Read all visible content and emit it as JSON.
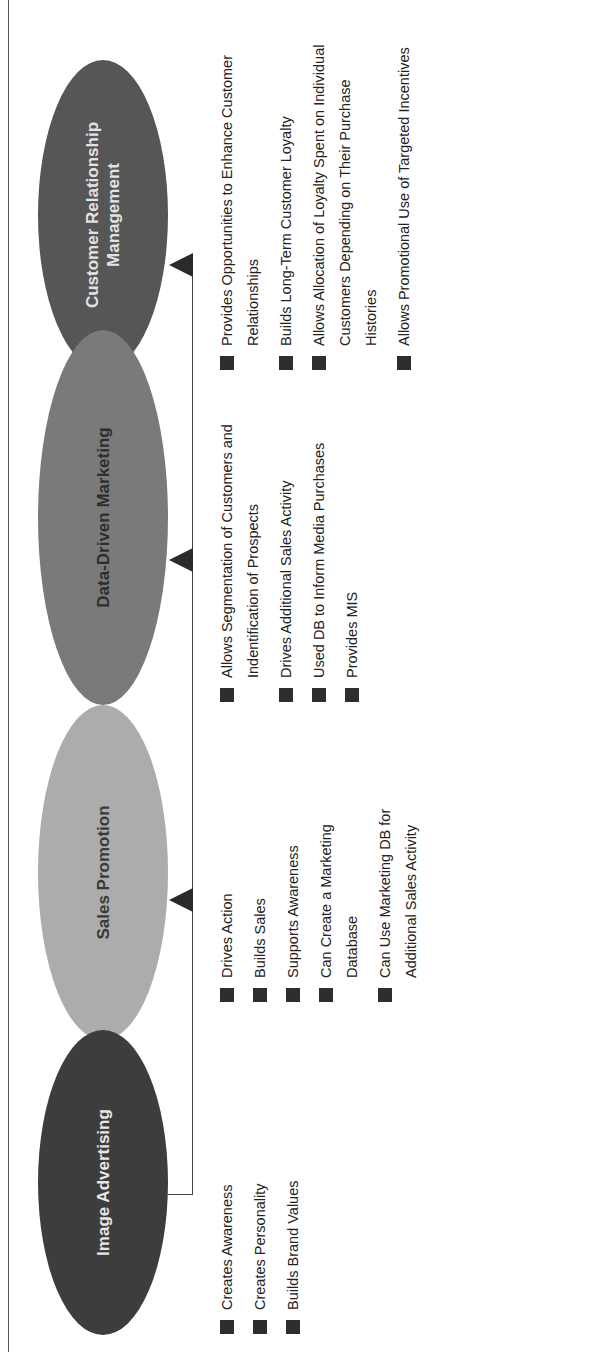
{
  "caption": "",
  "stages": [
    {
      "name": "Image Advertising",
      "color": "#3d3d3d",
      "bullets": [
        "Creates Awareness",
        "Creates Personality",
        "Builds Brand Values"
      ]
    },
    {
      "name": "Sales Promotion",
      "color": "#acacac",
      "bullets": [
        "Drives Action",
        "Builds Sales",
        "Supports Awareness",
        "Can Create a Marketing Database",
        "Can Use Marketing DB for Additional Sales Activity"
      ]
    },
    {
      "name": "Data-Driven Marketing",
      "color": "#7a7a7a",
      "bullets": [
        "Allows Segmentation of Customers and Indentification of Prospects",
        "Drives Additional Sales Activity",
        "Used DB to Inform Media Purchases",
        "Provides MIS"
      ]
    },
    {
      "name": "Customer Relationship Management",
      "color": "#565656",
      "bullets": [
        "Provides Opportunities to Enhance Customer Relationships",
        "Builds Long-Term Customer Loyalty",
        "Allows Allocation of Loyalty Spent on Individual Customers Depending on Their Purchase Histories",
        "Allows Promotional Use of Targeted Incentives"
      ]
    }
  ]
}
